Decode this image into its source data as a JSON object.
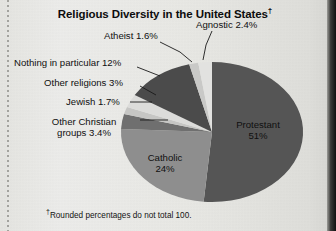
{
  "figure": {
    "title": "Religious Diversity in the United States",
    "title_dagger": "†",
    "footnote_dagger": "†",
    "footnote": "Rounded percentages do not total 100.",
    "page_bg": "#e9e9e5"
  },
  "chart_data": {
    "type": "pie",
    "title": "Religious Diversity in the United States",
    "xlabel": "",
    "ylabel": "",
    "legend": "none",
    "note": "Rounded percentages do not total 100.",
    "start_angle_deg": 0,
    "direction": "clockwise",
    "categories": [
      "Protestant",
      "Catholic",
      "Other Christian groups",
      "Jewish",
      "Other religions",
      "Nothing in particular",
      "Atheist",
      "Agnostic"
    ],
    "values": [
      51,
      24,
      3.4,
      1.7,
      3,
      12,
      1.6,
      2.4
    ],
    "value_labels": [
      "51%",
      "24%",
      "3.4%",
      "1.7%",
      "3%",
      "12%",
      "1.6%",
      "2.4%"
    ],
    "colors": [
      "#555555",
      "#8e8e8e",
      "#6f6f6f",
      "#c6c6c4",
      "#dcdcda",
      "#4b4b4b",
      "#c9c9c7",
      "#e2e2e0"
    ],
    "slices": [
      {
        "name": "Protestant",
        "value": 51,
        "label": "Protestant",
        "value_label": "51%",
        "color": "#555555"
      },
      {
        "name": "Catholic",
        "value": 24,
        "label": "Catholic",
        "value_label": "24%",
        "color": "#8e8e8e"
      },
      {
        "name": "Other Christian groups",
        "value": 3.4,
        "label": "Other Christian groups",
        "value_label": "3.4%",
        "color": "#6f6f6f"
      },
      {
        "name": "Jewish",
        "value": 1.7,
        "label": "Jewish",
        "value_label": "1.7%",
        "color": "#c6c6c4"
      },
      {
        "name": "Other religions",
        "value": 3,
        "label": "Other religions",
        "value_label": "3%",
        "color": "#dcdcda"
      },
      {
        "name": "Nothing in particular",
        "value": 12,
        "label": "Nothing in particular",
        "value_label": "12%",
        "color": "#4b4b4b"
      },
      {
        "name": "Atheist",
        "value": 1.6,
        "label": "Atheist",
        "value_label": "1.6%",
        "color": "#c9c9c7"
      },
      {
        "name": "Agnostic",
        "value": 2.4,
        "label": "Agnostic",
        "value_label": "2.4%",
        "color": "#e2e2e0"
      }
    ]
  },
  "labels": {
    "protestant": "Protestant",
    "protestant_pct": "51%",
    "catholic": "Catholic",
    "catholic_pct": "24%",
    "other_christian_line1": "Other Christian",
    "other_christian_line2": "groups 3.4%",
    "jewish": "Jewish 1.7%",
    "other_religions": "Other religions 3%",
    "nothing_in_particular": "Nothing in particular 12%",
    "atheist": "Atheist 1.6%",
    "agnostic": "Agnostic 2.4%"
  }
}
